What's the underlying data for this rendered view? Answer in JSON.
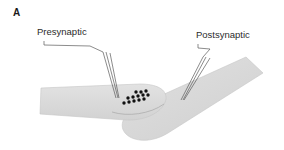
{
  "figure": {
    "panel_letter": "A",
    "background_color": "#ffffff",
    "membrane_fill": "#d9d9d9",
    "membrane_stroke": "#bfbfbf",
    "vesicle_color": "#111111",
    "leader_line_color": "#5a5a5a",
    "label_text_color": "#2b2b2b"
  },
  "labels": {
    "presynaptic": "Presynaptic",
    "postsynaptic": "Postsynaptic"
  },
  "structures": {
    "presynaptic_terminal": {
      "name": "presynaptic-terminal",
      "fill": "#d9d9d9",
      "path": "M 41 88 L 40 114 L 126 120 C 147 121 164 111 166 99 C 167 89 156 84 140 84 Z"
    },
    "postsynaptic_cell": {
      "name": "postsynaptic-cell",
      "fill": "#d9d9d9",
      "path": "M 246 57 L 263 73 L 168 133 C 152 143 134 142 126 134 C 118 126 123 114 138 106 Z"
    },
    "synaptic_cleft": {
      "name": "synaptic-cleft",
      "stroke": "#9a9a9a"
    }
  },
  "vesicles": {
    "name": "synaptic-vesicles",
    "count": 13,
    "radius": 1.7,
    "positions": [
      [
        124,
        103
      ],
      [
        129,
        102
      ],
      [
        134,
        101
      ],
      [
        139,
        100
      ],
      [
        144,
        99
      ],
      [
        128,
        98
      ],
      [
        133,
        97
      ],
      [
        138,
        96
      ],
      [
        143,
        95
      ],
      [
        148,
        95
      ],
      [
        136,
        92
      ],
      [
        141,
        92
      ],
      [
        146,
        91
      ]
    ]
  },
  "leader_lines": {
    "presynaptic": {
      "name": "presynaptic-leader-lines",
      "bracket": "M 44 41 L 44 45 L 90 46 L 103 52",
      "lines": [
        "M 103 52 L 116 98",
        "M 106 52 L 118 98",
        "M 110 53 L 119 98"
      ]
    },
    "postsynaptic": {
      "name": "postsynaptic-leader-lines",
      "bracket": "M 198 44 L 198 48 L 210 49 L 203 57",
      "lines": [
        "M 203 57 L 181 100",
        "M 206 57 L 183 100",
        "M 210 58 L 184 100"
      ]
    }
  }
}
